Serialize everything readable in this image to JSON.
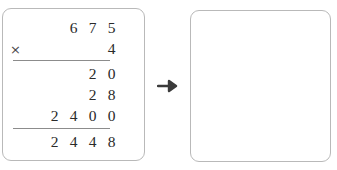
{
  "problem": {
    "type": "long-multiplication",
    "multiplicand": "675",
    "multiplier": "4",
    "operator": "×",
    "product": "2448",
    "partial_products": [
      "20",
      "28",
      "2400"
    ]
  },
  "left_panel": {
    "rows": [
      {
        "name": "multiplicand-row",
        "cells": [
          "",
          "6",
          "7",
          "5"
        ]
      },
      {
        "name": "multiplier-row",
        "operator": "×",
        "cells": [
          "",
          "",
          "",
          "4"
        ]
      },
      {
        "name": "partial-product-row-1",
        "cells": [
          "",
          "",
          "2",
          "0"
        ]
      },
      {
        "name": "partial-product-row-2",
        "cells": [
          "",
          "",
          "2",
          "8"
        ]
      },
      {
        "name": "partial-product-row-3",
        "cells": [
          "2",
          "4",
          "0",
          "0"
        ]
      },
      {
        "name": "total-row",
        "cells": [
          "2",
          "4",
          "4",
          "8"
        ]
      }
    ]
  },
  "connector": {
    "icon": "arrow-right-icon",
    "glyph": "→"
  },
  "right_panel": {
    "content": ""
  },
  "colors": {
    "panel_border": "#b9b9b9",
    "rule": "#8c8c8c",
    "digit_text": "#2a2a2a",
    "arrow": "#3b3b3b",
    "background": "#ffffff"
  }
}
